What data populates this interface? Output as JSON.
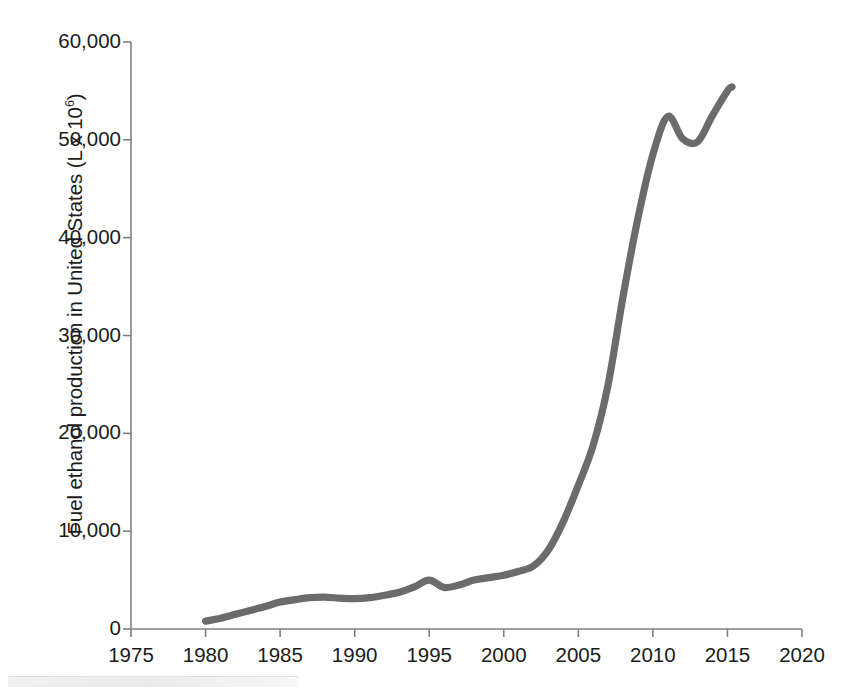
{
  "chart_data": {
    "type": "line",
    "title": "",
    "xlabel": "",
    "ylabel": "Fuel ethanol production in United States (L x 10⁶)",
    "ylabel_text": "Fuel ethanol production in United States (L x 10",
    "ylabel_exponent": "6",
    "ylabel_tail": ")",
    "xlim": [
      1975,
      2020
    ],
    "ylim": [
      0,
      60000
    ],
    "grid": false,
    "legend": "none",
    "line_color": "#6b6b6b",
    "axis_color": "#808080",
    "text_color": "#1c1c1c",
    "xticks": [
      1975,
      1980,
      1985,
      1990,
      1995,
      2000,
      2005,
      2010,
      2015,
      2020
    ],
    "xtick_labels": [
      "1975",
      "1980",
      "1985",
      "1990",
      "1995",
      "2000",
      "2005",
      "2010",
      "2015",
      "2020"
    ],
    "yticks": [
      0,
      10000,
      20000,
      30000,
      40000,
      50000,
      60000
    ],
    "ytick_labels": [
      "0",
      "10,000",
      "20,000",
      "30,000",
      "40,000",
      "50,000",
      "60,000"
    ],
    "series": [
      {
        "name": "Fuel ethanol production",
        "x": [
          1980,
          1981,
          1982,
          1983,
          1984,
          1985,
          1986,
          1987,
          1988,
          1989,
          1990,
          1991,
          1992,
          1993,
          1994,
          1995,
          1996,
          1997,
          1998,
          1999,
          2000,
          2001,
          2002,
          2003,
          2004,
          2005,
          2006,
          2007,
          2008,
          2009,
          2010,
          2011,
          2012,
          2013,
          2014,
          2015,
          2015.3
        ],
        "values": [
          800,
          1100,
          1500,
          1900,
          2300,
          2750,
          3000,
          3200,
          3250,
          3150,
          3100,
          3200,
          3450,
          3750,
          4300,
          5000,
          4250,
          4500,
          5000,
          5250,
          5500,
          5900,
          6450,
          8100,
          11000,
          14700,
          18800,
          25000,
          34000,
          42000,
          48500,
          52400,
          50100,
          49800,
          52500,
          55000,
          55400
        ]
      }
    ]
  },
  "axes": {
    "y_axis_name": "y-axis",
    "x_axis_name": "x-axis"
  }
}
